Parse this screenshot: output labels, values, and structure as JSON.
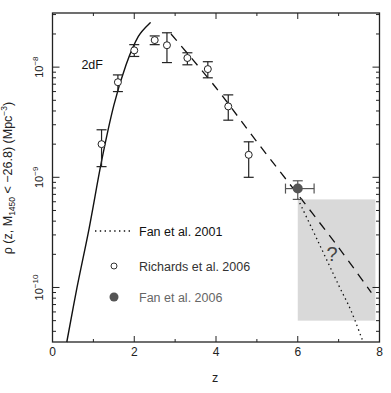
{
  "chart_data": {
    "type": "scatter",
    "title": "",
    "xlabel": "z",
    "ylabel": "ρ (z, M1450 < −26.8) (Mpc−3)",
    "ylabel_parts": {
      "rho": "ρ",
      "open": " (z, M",
      "sub": "1450",
      "mid": " < −26.8) (Mpc",
      "sup": "−3",
      "close": ")"
    },
    "xlim": [
      0,
      8
    ],
    "ylim": [
      3.2e-11,
      3.1e-08
    ],
    "yscale": "log",
    "x_ticks": [
      0,
      2,
      4,
      6,
      8
    ],
    "x_tick_labels": [
      "0",
      "2",
      "4",
      "6",
      "8"
    ],
    "y_ticks": [
      1e-10,
      1e-09,
      1e-08
    ],
    "y_tick_labels": [
      {
        "base": "10",
        "exp": "−10"
      },
      {
        "base": "10",
        "exp": "−9"
      },
      {
        "base": "10",
        "exp": "−8"
      }
    ],
    "grid": false,
    "legend_position": "center-left",
    "series": [
      {
        "name": "Richards et al. 2006",
        "marker": "open-circle",
        "x": [
          1.2,
          1.6,
          2.0,
          2.5,
          2.8,
          3.3,
          3.8,
          4.3,
          4.8
        ],
        "y": [
          2e-09,
          7.3e-09,
          1.42e-08,
          1.76e-08,
          1.58e-08,
          1.21e-08,
          9.6e-09,
          4.4e-09,
          1.6e-09
        ],
        "y_err_low": [
          1.25e-09,
          6e-09,
          1.25e-08,
          1.6e-08,
          1.1e-08,
          1.05e-08,
          8e-09,
          3.3e-09,
          1e-09
        ],
        "y_err_high": [
          2.7e-09,
          8.5e-09,
          1.6e-08,
          1.92e-08,
          2.05e-08,
          1.35e-08,
          1.12e-08,
          5.6e-09,
          2.1e-09
        ]
      },
      {
        "name": "Fan et al. 2006",
        "marker": "filled-circle",
        "color": "#555555",
        "x": [
          6.0
        ],
        "y": [
          7.9e-10
        ],
        "x_err": [
          [
            5.7,
            6.4
          ]
        ],
        "y_err_low": [
          6.3e-10
        ],
        "y_err_high": [
          9.3e-10
        ]
      },
      {
        "name": "Fan et al. 2001",
        "line": "dotted",
        "x": [
          6.0,
          6.5,
          7.0,
          7.3,
          7.6
        ],
        "y": [
          6.4e-10,
          2.6e-10,
          1.05e-10,
          6.2e-11,
          3.2e-11
        ]
      },
      {
        "name": "2dF",
        "line": "solid",
        "x": [
          0.35,
          0.6,
          0.9,
          1.2,
          1.5,
          1.8,
          2.1,
          2.4
        ],
        "y": [
          3.2e-11,
          1e-10,
          3.5e-10,
          1.4e-09,
          4.5e-09,
          1.05e-08,
          1.9e-08,
          2.55e-08
        ]
      },
      {
        "name": "power-law fit",
        "line": "dashed",
        "x": [
          2.9,
          4.0,
          5.0,
          6.0,
          7.0,
          7.8
        ],
        "y": [
          2e-08,
          6.5e-09,
          2.1e-09,
          7e-10,
          2.3e-10,
          9e-11
        ]
      }
    ],
    "annotations": [
      {
        "text": "2dF",
        "x": 1.05,
        "y": 1.05e-08
      },
      {
        "text": "?",
        "x": 6.85,
        "y": 2e-10
      },
      {
        "shape": "shaded-box",
        "x0": 6.0,
        "x1": 7.9,
        "y0": 5e-11,
        "y1": 6.3e-10,
        "color": "#d9d9d9"
      }
    ]
  },
  "legend": {
    "items": [
      {
        "label": "Fan et al. 2001",
        "symbol": "dotted-line",
        "color": "#111111"
      },
      {
        "label": "Richards et al. 2006",
        "symbol": "open-circle",
        "color": "#333333"
      },
      {
        "label": "Fan et al. 2006",
        "symbol": "filled-circle",
        "color": "#666666"
      }
    ]
  },
  "labels": {
    "curve_2df": "2dF",
    "question_mark": "?"
  }
}
